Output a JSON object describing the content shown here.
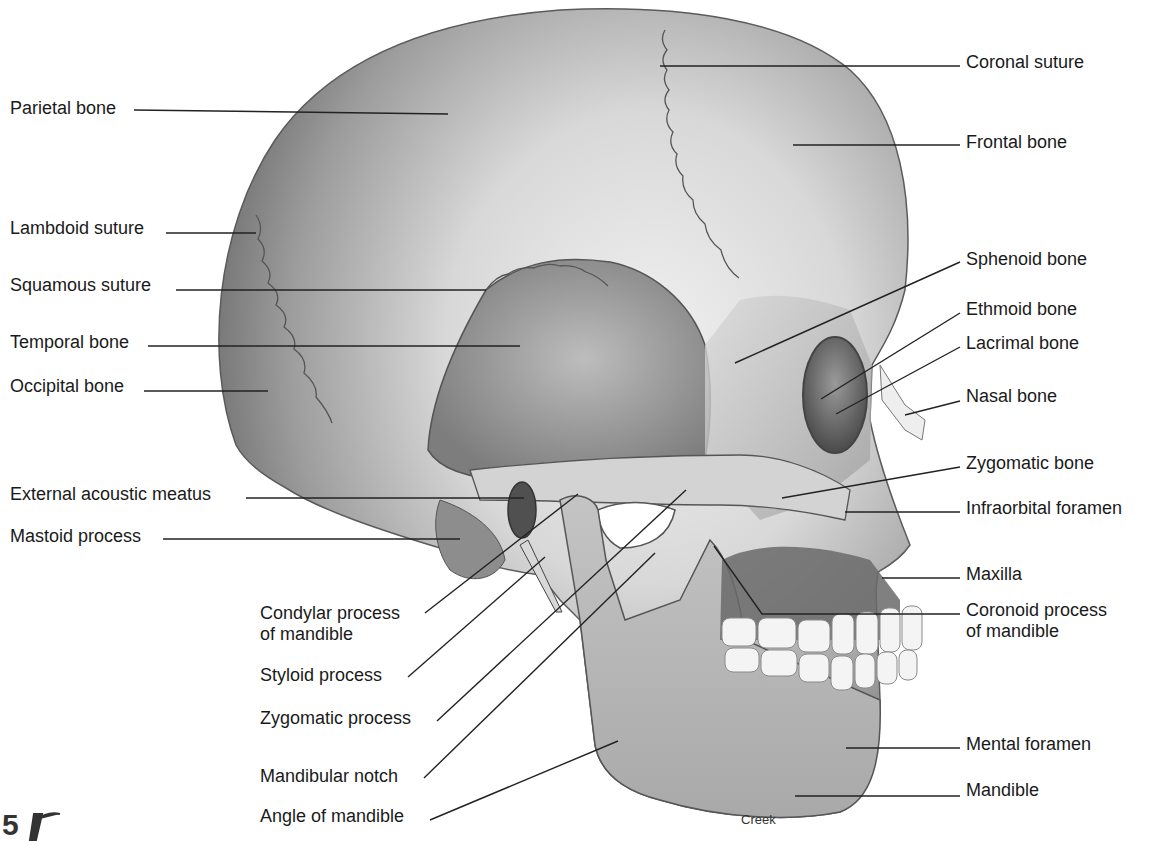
{
  "figure": {
    "credit": "Creek",
    "page_mark": "5",
    "colors": {
      "background": "#ffffff",
      "label_text": "#1a1a1a",
      "leader_line": "#222222",
      "bone_light": "#e6e6e6",
      "bone_mid": "#b5b5b5",
      "bone_dark": "#7a7a7a",
      "shadow": "#3c3c3c",
      "teeth": "#f4f4f4"
    }
  },
  "labels_left": [
    {
      "text": "Parietal bone",
      "x": 10,
      "y": 98,
      "line": [
        134,
        110,
        448,
        114
      ]
    },
    {
      "text": "Lambdoid suture",
      "x": 10,
      "y": 218,
      "line": [
        166,
        233,
        256,
        233
      ]
    },
    {
      "text": "Squamous suture",
      "x": 10,
      "y": 275,
      "line": [
        176,
        290,
        486,
        290
      ]
    },
    {
      "text": "Temporal bone",
      "x": 10,
      "y": 332,
      "line": [
        148,
        346,
        520,
        346
      ]
    },
    {
      "text": "Occipital bone",
      "x": 10,
      "y": 376,
      "line": [
        144,
        391,
        268,
        391
      ]
    },
    {
      "text": "External acoustic meatus",
      "x": 10,
      "y": 484,
      "line": [
        246,
        498,
        524,
        498
      ]
    },
    {
      "text": "Mastoid process",
      "x": 10,
      "y": 526,
      "line": [
        163,
        539,
        460,
        539
      ]
    }
  ],
  "labels_bottom": [
    {
      "text": "Condylar process\nof mandible",
      "x": 260,
      "y": 603,
      "line": [
        425,
        613,
        578,
        494
      ]
    },
    {
      "text": "Styloid process",
      "x": 260,
      "y": 665,
      "line": [
        408,
        677,
        545,
        557
      ]
    },
    {
      "text": "Zygomatic process",
      "x": 260,
      "y": 708,
      "line": [
        437,
        721,
        686,
        490
      ]
    },
    {
      "text": "Mandibular notch",
      "x": 260,
      "y": 766,
      "line": [
        424,
        778,
        655,
        553
      ]
    },
    {
      "text": "Angle of mandible",
      "x": 260,
      "y": 806,
      "line": [
        430,
        820,
        618,
        741
      ]
    }
  ],
  "labels_right": [
    {
      "text": "Coronal suture",
      "x": 966,
      "y": 52,
      "line": [
        660,
        66,
        960,
        66
      ]
    },
    {
      "text": "Frontal bone",
      "x": 966,
      "y": 132,
      "line": [
        793,
        145,
        960,
        145
      ]
    },
    {
      "text": "Sphenoid bone",
      "x": 966,
      "y": 249,
      "line": [
        735,
        363,
        960,
        262
      ]
    },
    {
      "text": "Ethmoid bone",
      "x": 966,
      "y": 299,
      "line": [
        821,
        399,
        960,
        313
      ]
    },
    {
      "text": "Lacrimal bone",
      "x": 966,
      "y": 333,
      "line": [
        836,
        414,
        960,
        347
      ]
    },
    {
      "text": "Nasal bone",
      "x": 966,
      "y": 386,
      "line": [
        905,
        415,
        960,
        401
      ]
    },
    {
      "text": "Zygomatic bone",
      "x": 966,
      "y": 453,
      "line": [
        782,
        498,
        960,
        467
      ]
    },
    {
      "text": "Infraorbital foramen",
      "x": 966,
      "y": 498,
      "line": [
        845,
        512,
        960,
        512
      ]
    },
    {
      "text": "Maxilla",
      "x": 966,
      "y": 564,
      "line": [
        882,
        578,
        960,
        578
      ]
    },
    {
      "text": "Coronoid process\nof mandible",
      "x": 966,
      "y": 600,
      "line": [
        714,
        546,
        762,
        614,
        960,
        614
      ]
    },
    {
      "text": "Mental foramen",
      "x": 966,
      "y": 734,
      "line": [
        846,
        748,
        960,
        748
      ]
    },
    {
      "text": "Mandible",
      "x": 966,
      "y": 780,
      "line": [
        795,
        796,
        960,
        796
      ]
    }
  ]
}
